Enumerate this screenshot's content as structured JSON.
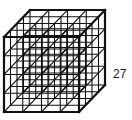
{
  "figure": {
    "divisions_per_edge": 4,
    "line_color": "#111111",
    "label": "27"
  }
}
